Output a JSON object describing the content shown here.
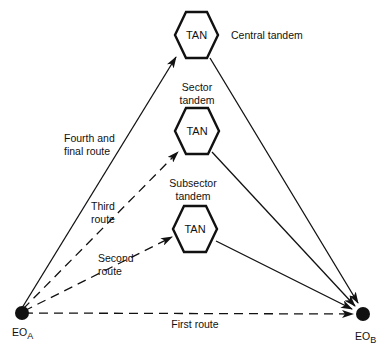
{
  "diagram": {
    "nodes": {
      "eo_a": {
        "label": "EO",
        "sub": "A"
      },
      "eo_b": {
        "label": "EO",
        "sub": "B"
      },
      "central": {
        "tan": "TAN",
        "label": "Central tandem"
      },
      "sector": {
        "tan": "TAN",
        "label_line1": "Sector",
        "label_line2": "tandem"
      },
      "subsector": {
        "tan": "TAN",
        "label_line1": "Subsector",
        "label_line2": "tandem"
      }
    },
    "routes": {
      "first": {
        "label": "First route",
        "style": "dashed"
      },
      "second": {
        "line1": "Second",
        "line2": "route",
        "style": "dashed"
      },
      "third": {
        "line1": "Third",
        "line2": "route",
        "style": "dashed"
      },
      "fourth": {
        "line1": "Fourth and",
        "line2": "final route",
        "style": "solid"
      }
    },
    "colors": {
      "ink": "#111111",
      "background": "#ffffff"
    }
  }
}
